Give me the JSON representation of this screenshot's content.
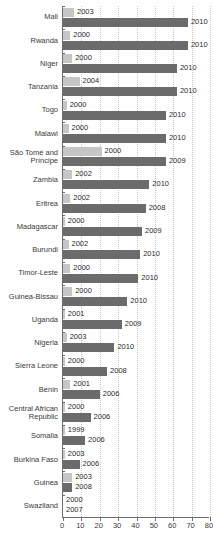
{
  "chart_data": {
    "type": "bar",
    "orientation": "horizontal",
    "title": "",
    "subtitle": "",
    "xlabel": "",
    "ylabel": "",
    "xlim": [
      0,
      80
    ],
    "xticks": [
      0,
      10,
      20,
      30,
      40,
      50,
      60,
      70,
      80
    ],
    "grid": true,
    "grid_axis": "x",
    "legend": "none",
    "colors": {
      "earlier": "#c6c6c6",
      "later": "#6b6b6b",
      "axis": "#6f6f6f",
      "grid": "#c9c9c9"
    },
    "categories": [
      "Mali",
      "Rwanda",
      "Niger",
      "Tanzania",
      "Togo",
      "Malawi",
      "São Tomé and\nPríncipe",
      "Zambia",
      "Eritrea",
      "Madagascar",
      "Burundi",
      "Timor-Leste",
      "Guinea-Bissau",
      "Uganda",
      "Nigeria",
      "Sierra Leone",
      "Benin",
      "Central African\nRepublic",
      "Somalia",
      "Burkina Faso",
      "Guinea",
      "Swaziland"
    ],
    "series": [
      {
        "name": "earlier year",
        "color": "#c6c6c6",
        "year_labels": [
          "2003",
          "2000",
          "2000",
          "2004",
          "2000",
          "2000",
          "2000",
          "2002",
          "2002",
          "2000",
          "2002",
          "2000",
          "2000",
          "2001",
          "2003",
          "2000",
          "2001",
          "2000",
          "1999",
          "2003",
          "2003",
          "2000"
        ],
        "values": [
          6,
          4,
          5,
          9,
          2,
          3,
          21,
          5,
          4,
          1,
          3,
          4,
          5,
          1,
          2,
          1,
          4,
          1,
          1,
          1,
          5,
          0
        ]
      },
      {
        "name": "later year",
        "color": "#6b6b6b",
        "year_labels": [
          "2010",
          "2010",
          "2010",
          "2010",
          "2010",
          "2010",
          "2009",
          "2010",
          "2008",
          "2009",
          "2010",
          "2010",
          "2010",
          "2009",
          "2010",
          "2008",
          "2006",
          "2006",
          "2006",
          "2006",
          "2008",
          "2007"
        ],
        "values": [
          68,
          68,
          62,
          62,
          56,
          56,
          56,
          47,
          45,
          43,
          42,
          41,
          35,
          32,
          28,
          24,
          20,
          15,
          12,
          9,
          5,
          0
        ]
      }
    ]
  }
}
